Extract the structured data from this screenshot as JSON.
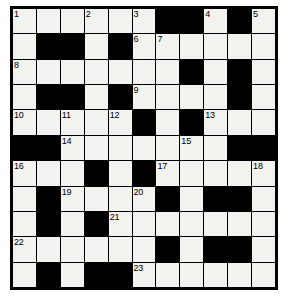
{
  "puzzle": {
    "title": "Crossword Grid",
    "rows": 11,
    "cols": 11,
    "colors": {
      "block": "#000000",
      "open": "#f2f2ef",
      "border": "#000000",
      "number_text": "#000000"
    },
    "grid": [
      [
        {
          "type": "open",
          "number": "1"
        },
        {
          "type": "open",
          "number": ""
        },
        {
          "type": "open",
          "number": ""
        },
        {
          "type": "open",
          "number": "2"
        },
        {
          "type": "open",
          "number": ""
        },
        {
          "type": "open",
          "number": "3"
        },
        {
          "type": "block",
          "number": ""
        },
        {
          "type": "block",
          "number": ""
        },
        {
          "type": "open",
          "number": "4"
        },
        {
          "type": "block",
          "number": ""
        },
        {
          "type": "open",
          "number": "5"
        }
      ],
      [
        {
          "type": "open",
          "number": ""
        },
        {
          "type": "block",
          "number": ""
        },
        {
          "type": "block",
          "number": ""
        },
        {
          "type": "open",
          "number": ""
        },
        {
          "type": "block",
          "number": ""
        },
        {
          "type": "open",
          "number": "6"
        },
        {
          "type": "open",
          "number": "7"
        },
        {
          "type": "open",
          "number": ""
        },
        {
          "type": "open",
          "number": ""
        },
        {
          "type": "open",
          "number": ""
        },
        {
          "type": "open",
          "number": ""
        }
      ],
      [
        {
          "type": "open",
          "number": "8"
        },
        {
          "type": "open",
          "number": ""
        },
        {
          "type": "open",
          "number": ""
        },
        {
          "type": "open",
          "number": ""
        },
        {
          "type": "open",
          "number": ""
        },
        {
          "type": "open",
          "number": ""
        },
        {
          "type": "open",
          "number": ""
        },
        {
          "type": "block",
          "number": ""
        },
        {
          "type": "open",
          "number": ""
        },
        {
          "type": "block",
          "number": ""
        },
        {
          "type": "open",
          "number": ""
        }
      ],
      [
        {
          "type": "open",
          "number": ""
        },
        {
          "type": "block",
          "number": ""
        },
        {
          "type": "block",
          "number": ""
        },
        {
          "type": "open",
          "number": ""
        },
        {
          "type": "block",
          "number": ""
        },
        {
          "type": "open",
          "number": "9"
        },
        {
          "type": "open",
          "number": ""
        },
        {
          "type": "open",
          "number": ""
        },
        {
          "type": "open",
          "number": ""
        },
        {
          "type": "block",
          "number": ""
        },
        {
          "type": "open",
          "number": ""
        }
      ],
      [
        {
          "type": "open",
          "number": "10"
        },
        {
          "type": "open",
          "number": ""
        },
        {
          "type": "open",
          "number": "11"
        },
        {
          "type": "open",
          "number": ""
        },
        {
          "type": "open",
          "number": "12"
        },
        {
          "type": "block",
          "number": ""
        },
        {
          "type": "open",
          "number": ""
        },
        {
          "type": "block",
          "number": ""
        },
        {
          "type": "open",
          "number": "13"
        },
        {
          "type": "open",
          "number": ""
        },
        {
          "type": "open",
          "number": ""
        }
      ],
      [
        {
          "type": "block",
          "number": ""
        },
        {
          "type": "block",
          "number": ""
        },
        {
          "type": "open",
          "number": "14"
        },
        {
          "type": "open",
          "number": ""
        },
        {
          "type": "open",
          "number": ""
        },
        {
          "type": "open",
          "number": ""
        },
        {
          "type": "open",
          "number": ""
        },
        {
          "type": "open",
          "number": "15"
        },
        {
          "type": "open",
          "number": ""
        },
        {
          "type": "block",
          "number": ""
        },
        {
          "type": "block",
          "number": ""
        }
      ],
      [
        {
          "type": "open",
          "number": "16"
        },
        {
          "type": "open",
          "number": ""
        },
        {
          "type": "open",
          "number": ""
        },
        {
          "type": "block",
          "number": ""
        },
        {
          "type": "open",
          "number": ""
        },
        {
          "type": "block",
          "number": ""
        },
        {
          "type": "open",
          "number": "17"
        },
        {
          "type": "open",
          "number": ""
        },
        {
          "type": "open",
          "number": ""
        },
        {
          "type": "open",
          "number": ""
        },
        {
          "type": "open",
          "number": "18"
        }
      ],
      [
        {
          "type": "open",
          "number": ""
        },
        {
          "type": "block",
          "number": ""
        },
        {
          "type": "open",
          "number": "19"
        },
        {
          "type": "open",
          "number": ""
        },
        {
          "type": "open",
          "number": ""
        },
        {
          "type": "open",
          "number": "20"
        },
        {
          "type": "block",
          "number": ""
        },
        {
          "type": "open",
          "number": ""
        },
        {
          "type": "block",
          "number": ""
        },
        {
          "type": "block",
          "number": ""
        },
        {
          "type": "open",
          "number": ""
        }
      ],
      [
        {
          "type": "open",
          "number": ""
        },
        {
          "type": "block",
          "number": ""
        },
        {
          "type": "open",
          "number": ""
        },
        {
          "type": "block",
          "number": ""
        },
        {
          "type": "open",
          "number": "21"
        },
        {
          "type": "open",
          "number": ""
        },
        {
          "type": "open",
          "number": ""
        },
        {
          "type": "open",
          "number": ""
        },
        {
          "type": "open",
          "number": ""
        },
        {
          "type": "open",
          "number": ""
        },
        {
          "type": "open",
          "number": ""
        }
      ],
      [
        {
          "type": "open",
          "number": "22"
        },
        {
          "type": "open",
          "number": ""
        },
        {
          "type": "open",
          "number": ""
        },
        {
          "type": "open",
          "number": ""
        },
        {
          "type": "open",
          "number": ""
        },
        {
          "type": "open",
          "number": ""
        },
        {
          "type": "block",
          "number": ""
        },
        {
          "type": "open",
          "number": ""
        },
        {
          "type": "block",
          "number": ""
        },
        {
          "type": "block",
          "number": ""
        },
        {
          "type": "open",
          "number": ""
        }
      ],
      [
        {
          "type": "open",
          "number": ""
        },
        {
          "type": "block",
          "number": ""
        },
        {
          "type": "open",
          "number": ""
        },
        {
          "type": "block",
          "number": ""
        },
        {
          "type": "block",
          "number": ""
        },
        {
          "type": "open",
          "number": "23"
        },
        {
          "type": "open",
          "number": ""
        },
        {
          "type": "open",
          "number": ""
        },
        {
          "type": "open",
          "number": ""
        },
        {
          "type": "open",
          "number": ""
        },
        {
          "type": "open",
          "number": ""
        }
      ]
    ]
  }
}
